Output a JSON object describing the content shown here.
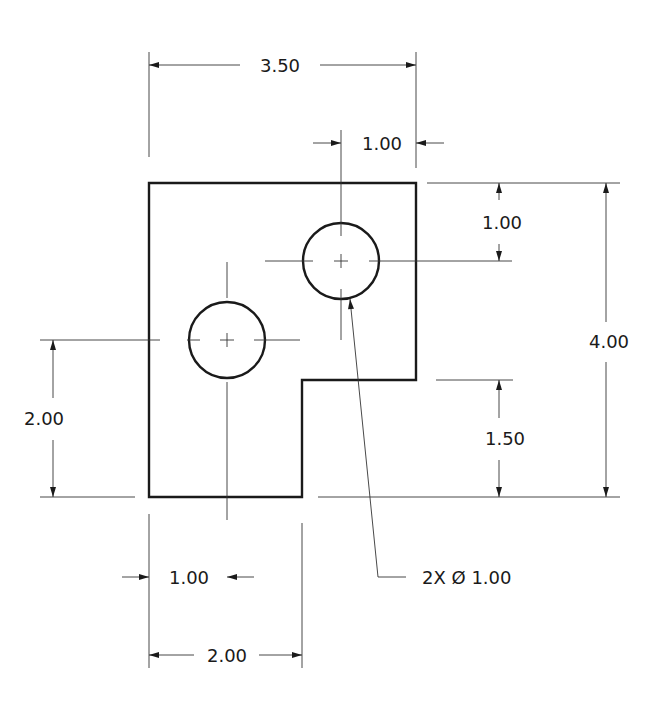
{
  "drawing": {
    "type": "engineering-drawing",
    "units_per_px": 76.3,
    "part": {
      "outline": "L-shaped plate with notch in bottom-right",
      "width": "3.50",
      "height": "4.00"
    },
    "dimensions": {
      "overall_width": "3.50",
      "hole2_from_right": "1.00",
      "hole2_from_top": "1.00",
      "overall_height": "4.00",
      "notch_height": "1.50",
      "hole1_from_bottom": "2.00",
      "hole1_from_left": "1.00",
      "bottom_width": "2.00"
    },
    "callout": {
      "holes": "2X Ø 1.00"
    }
  }
}
